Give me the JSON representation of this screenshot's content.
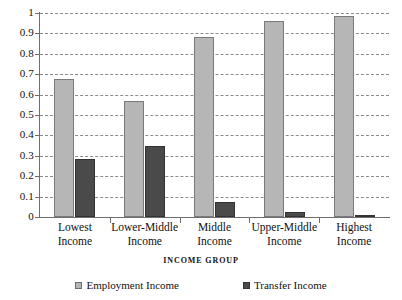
{
  "chart_data": {
    "type": "bar",
    "title": "",
    "xlabel": "INCOME GROUP",
    "ylabel": "",
    "ylim": [
      0,
      1
    ],
    "yticks": [
      "0",
      "0.1",
      "0.2",
      "0.3",
      "0.4",
      "0.5",
      "0.6",
      "0.7",
      "0.8",
      "0.9",
      "1"
    ],
    "grid": true,
    "legend_position": "bottom",
    "categories": [
      "Lowest Income",
      "Lower-Middle Income",
      "Middle Income",
      "Upper-Middle Income",
      "Highest Income"
    ],
    "category_lines": [
      [
        "Lowest",
        "Income"
      ],
      [
        "Lower-Middle",
        "Income"
      ],
      [
        "Middle",
        "Income"
      ],
      [
        "Upper-Middle",
        "Income"
      ],
      [
        "Highest",
        "Income"
      ]
    ],
    "series": [
      {
        "name": "Employment Income",
        "color": "#b6b6b6",
        "values": [
          0.675,
          0.57,
          0.88,
          0.96,
          0.985
        ]
      },
      {
        "name": "Transfer Income",
        "color": "#4a4a4a",
        "values": [
          0.285,
          0.35,
          0.075,
          0.025,
          0.005
        ]
      }
    ]
  },
  "legend": {
    "items": [
      {
        "label": "Employment Income",
        "swatch": "employment"
      },
      {
        "label": "Transfer Income",
        "swatch": "transfer"
      }
    ]
  },
  "colors": {
    "employment": "#b6b6b6",
    "transfer": "#4a4a4a",
    "axis": "#6e6e6e",
    "gridline": "#8c8c8c",
    "background": "#ffffff",
    "text": "#111111"
  }
}
